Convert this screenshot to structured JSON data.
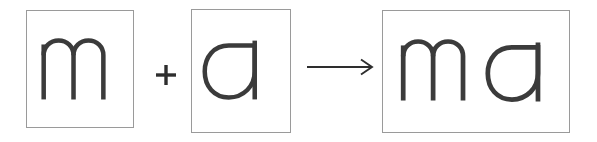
{
  "diagram": {
    "type": "letter-blending-equation",
    "title": "m + a -> ma",
    "background_color": "#ffffff",
    "stroke_color": "#3b3b3b",
    "operator_color": "#2e2e2e",
    "card_border_color": "#9a9a9a",
    "card_fill_color": "#ffffff",
    "cards": [
      {
        "id": "card-1",
        "letter": "m",
        "role": "first-letter",
        "x": 26,
        "y": 10,
        "width": 108,
        "height": 118
      },
      {
        "id": "card-2",
        "letter": "a",
        "role": "second-letter",
        "x": 191,
        "y": 9,
        "width": 100,
        "height": 124
      },
      {
        "id": "card-3",
        "letter": "ma",
        "role": "result-syllable",
        "x": 382,
        "y": 10,
        "width": 188,
        "height": 123
      }
    ],
    "operators": [
      {
        "id": "plus",
        "symbol": "+",
        "name": "plus-sign",
        "x": 152,
        "y": 61,
        "width": 28,
        "height": 28
      },
      {
        "id": "arrow",
        "symbol": "→",
        "name": "right-arrow",
        "x": 305,
        "y": 56,
        "width": 70,
        "height": 22
      }
    ]
  }
}
